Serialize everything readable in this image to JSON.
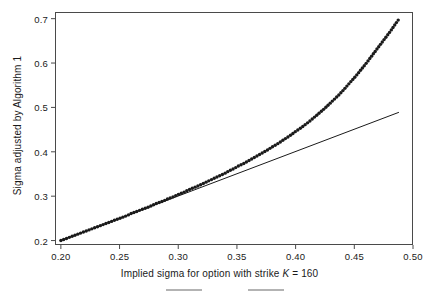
{
  "chart_data": {
    "type": "line",
    "title": "",
    "xlabel": "Implied sigma for option with strike K = 160",
    "xlabel_parts": {
      "before": "Implied sigma for option with strike ",
      "italic": "K",
      "after": " = 160"
    },
    "ylabel": "Sigma adjusted by Algorithm 1",
    "xlim": [
      0.195,
      0.5
    ],
    "ylim": [
      0.19,
      0.715
    ],
    "xticks": [
      0.2,
      0.25,
      0.3,
      0.35,
      0.4,
      0.45,
      0.5
    ],
    "xticklabels": [
      "0.20",
      "0.25",
      "0.30",
      "0.35",
      "0.40",
      "0.45",
      "0.50"
    ],
    "yticks": [
      0.2,
      0.3,
      0.4,
      0.5,
      0.6,
      0.7
    ],
    "yticklabels": [
      "0.2",
      "0.3",
      "0.4",
      "0.5",
      "0.6",
      "0.7"
    ],
    "grid": false,
    "legend": null,
    "frame": "box",
    "tick_direction": "out",
    "series": [
      {
        "name": "reference-line",
        "style": "solid",
        "color": "#1a1a1a",
        "linewidth": 1,
        "x": [
          0.2,
          0.488
        ],
        "values": [
          0.2,
          0.489
        ]
      },
      {
        "name": "adjusted-sigma",
        "style": "dotted",
        "color": "#1a1a1a",
        "markersize": 1.7,
        "x": [
          0.2,
          0.204,
          0.208,
          0.212,
          0.216,
          0.22,
          0.224,
          0.228,
          0.232,
          0.236,
          0.24,
          0.244,
          0.248,
          0.252,
          0.256,
          0.26,
          0.264,
          0.268,
          0.272,
          0.276,
          0.28,
          0.284,
          0.288,
          0.292,
          0.296,
          0.3,
          0.304,
          0.308,
          0.312,
          0.316,
          0.32,
          0.324,
          0.328,
          0.332,
          0.336,
          0.34,
          0.344,
          0.348,
          0.352,
          0.356,
          0.36,
          0.364,
          0.368,
          0.372,
          0.376,
          0.38,
          0.384,
          0.388,
          0.392,
          0.396,
          0.4,
          0.404,
          0.408,
          0.412,
          0.416,
          0.42,
          0.424,
          0.428,
          0.432,
          0.436,
          0.44,
          0.444,
          0.448,
          0.452,
          0.456,
          0.46,
          0.464,
          0.468,
          0.472,
          0.476,
          0.48,
          0.484,
          0.488
        ],
        "values": [
          0.2,
          0.204,
          0.208,
          0.212,
          0.216,
          0.22,
          0.224,
          0.228,
          0.232,
          0.236,
          0.24,
          0.244,
          0.248,
          0.252,
          0.256,
          0.261,
          0.265,
          0.269,
          0.273,
          0.277,
          0.282,
          0.286,
          0.29,
          0.295,
          0.299,
          0.304,
          0.308,
          0.313,
          0.318,
          0.322,
          0.327,
          0.332,
          0.337,
          0.342,
          0.347,
          0.352,
          0.358,
          0.363,
          0.369,
          0.374,
          0.38,
          0.386,
          0.392,
          0.398,
          0.404,
          0.411,
          0.417,
          0.424,
          0.431,
          0.438,
          0.446,
          0.453,
          0.461,
          0.469,
          0.478,
          0.487,
          0.496,
          0.506,
          0.516,
          0.526,
          0.537,
          0.549,
          0.561,
          0.573,
          0.586,
          0.599,
          0.613,
          0.627,
          0.641,
          0.655,
          0.669,
          0.684,
          0.699
        ]
      }
    ]
  },
  "figure": {
    "background_color": "#ffffff",
    "axis_color": "#4a4a4a",
    "ink_color": "#1a1a1a"
  }
}
